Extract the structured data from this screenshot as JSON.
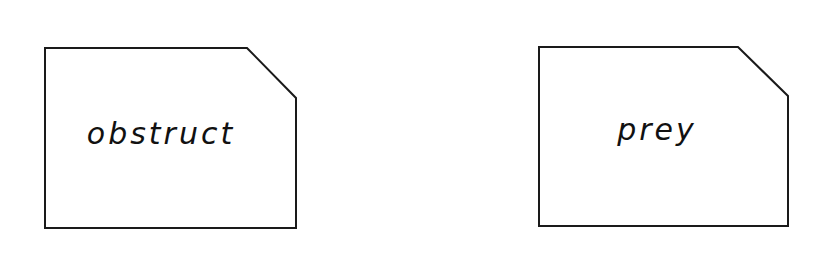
{
  "cards": [
    {
      "label": "obstruct"
    },
    {
      "label": "prey"
    }
  ],
  "colors": {
    "stroke": "#1a1a1a",
    "background": "#ffffff"
  }
}
